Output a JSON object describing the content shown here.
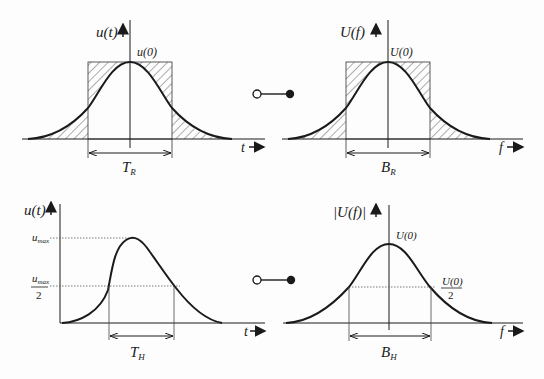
{
  "panels": {
    "top_left": {
      "y_label": "u(t)",
      "peak_label": "u(0)",
      "x_label": "t",
      "width_label": "T",
      "width_sub": "R"
    },
    "top_right": {
      "y_label": "U(f)",
      "peak_label": "U(0)",
      "x_label": "f",
      "width_label": "B",
      "width_sub": "R"
    },
    "bottom_left": {
      "y_label": "u(t)",
      "max_label": "u",
      "max_sub": "max",
      "half_num": "u",
      "half_num_sub": "max",
      "half_den": "2",
      "x_label": "t",
      "width_label": "T",
      "width_sub": "H"
    },
    "bottom_right": {
      "y_label": "|U(f)|",
      "peak_label": "U(0)",
      "half_num": "U(0)",
      "half_den": "2",
      "x_label": "f",
      "width_label": "B",
      "width_sub": "H"
    }
  },
  "connectors": [
    {
      "name": "fourier-correspondence-top"
    },
    {
      "name": "fourier-correspondence-bottom"
    }
  ],
  "colors": {
    "ink": "#1a1a1a",
    "paper": "#fdfdfd"
  }
}
